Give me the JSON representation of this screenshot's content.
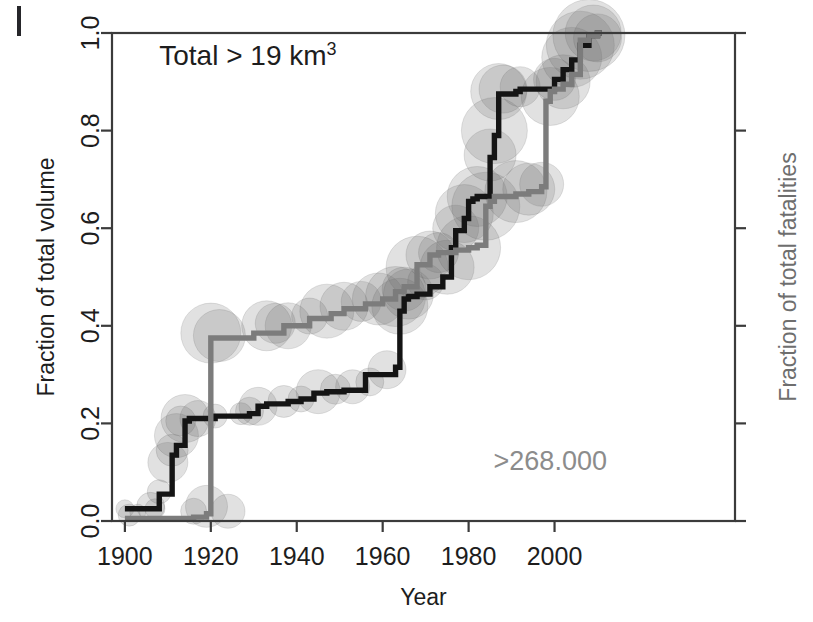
{
  "figure": {
    "background_color": "#ffffff",
    "scan_artifact": "vertical-bar-top-left"
  },
  "chart_data": {
    "type": "line",
    "title": "",
    "xlabel": "Year",
    "ylabel": "Fraction of total volume",
    "ylabel_right": "Fraction of total fatalities",
    "xlim": [
      1897,
      2042
    ],
    "ylim": [
      0.0,
      1.0
    ],
    "grid": false,
    "legend": "none",
    "x_ticks": [
      1900,
      1920,
      1940,
      1960,
      1980,
      2000
    ],
    "x_tick_labels": [
      "1900",
      "1920",
      "1940",
      "1960",
      "1980",
      "2000"
    ],
    "y_ticks": [
      0.0,
      0.2,
      0.4,
      0.6,
      0.8,
      1.0
    ],
    "y_tick_labels": [
      "0.0",
      "0.2",
      "0.4",
      "0.6",
      "0.8",
      "1.0"
    ],
    "y_ticks_right": [
      0.0,
      0.2,
      0.4,
      0.6,
      0.8,
      1.0
    ],
    "y_tick_labels_right": [
      "",
      "",
      "",
      "",
      "",
      ""
    ],
    "annotations": [
      {
        "name": "total-volume-annotation",
        "text": "Total > 19 km",
        "superscript": "3",
        "color": "#1d1d1d",
        "x": 1908,
        "y": 0.935
      },
      {
        "name": "total-fatalities-annotation",
        "text": ">268.000",
        "color": "#8c8c8c",
        "x": 1999,
        "y": 0.105
      }
    ],
    "series": [
      {
        "name": "Fraction of total volume",
        "color": "#141414",
        "axis": "left",
        "step": true,
        "x": [
          1900,
          1907,
          1908,
          1911,
          1912,
          1914,
          1915,
          1921,
          1929,
          1931,
          1933,
          1938,
          1941,
          1944,
          1947,
          1951,
          1953,
          1955,
          1956,
          1963,
          1964,
          1965,
          1966,
          1968,
          1971,
          1974,
          1976,
          1977,
          1979,
          1980,
          1981,
          1982,
          1985,
          1986,
          1987,
          1991,
          1992,
          2000,
          2002,
          2004,
          2006,
          2008,
          2010,
          2011
        ],
        "y": [
          0.025,
          0.025,
          0.055,
          0.135,
          0.155,
          0.205,
          0.21,
          0.215,
          0.22,
          0.235,
          0.24,
          0.245,
          0.25,
          0.262,
          0.265,
          0.268,
          0.268,
          0.268,
          0.3,
          0.315,
          0.43,
          0.455,
          0.46,
          0.465,
          0.48,
          0.5,
          0.56,
          0.595,
          0.62,
          0.655,
          0.66,
          0.665,
          0.745,
          0.79,
          0.875,
          0.88,
          0.885,
          0.905,
          0.925,
          0.945,
          0.975,
          0.995,
          1.0,
          1.0
        ]
      },
      {
        "name": "Fraction of total fatalities",
        "color": "#7c7c7c",
        "axis": "right",
        "step": true,
        "x": [
          1900,
          1912,
          1916,
          1919,
          1920,
          1930,
          1937,
          1943,
          1948,
          1951,
          1956,
          1960,
          1963,
          1965,
          1968,
          1971,
          1973,
          1977,
          1980,
          1982,
          1984,
          1985,
          1986,
          1991,
          1994,
          1997,
          1998,
          1999,
          2000,
          2002,
          2004,
          2006,
          2008,
          2010,
          2011
        ],
        "y": [
          0.005,
          0.005,
          0.008,
          0.015,
          0.375,
          0.385,
          0.4,
          0.415,
          0.425,
          0.435,
          0.445,
          0.455,
          0.47,
          0.48,
          0.525,
          0.545,
          0.55,
          0.555,
          0.56,
          0.565,
          0.645,
          0.655,
          0.665,
          0.67,
          0.675,
          0.685,
          0.86,
          0.88,
          0.885,
          0.895,
          0.915,
          0.985,
          0.995,
          1.0,
          1.0
        ]
      }
    ],
    "bubbles": {
      "description": "semi-transparent gray circles sized by event magnitude, overlaid on both step curves",
      "color": "#6b6b6b",
      "opacity": 0.2,
      "points": [
        {
          "x": 1900,
          "y": 0.025,
          "r": 9
        },
        {
          "x": 1901,
          "y": 0.012,
          "r": 11
        },
        {
          "x": 1903,
          "y": 0.018,
          "r": 8
        },
        {
          "x": 1906,
          "y": 0.03,
          "r": 14
        },
        {
          "x": 1907,
          "y": 0.025,
          "r": 10
        },
        {
          "x": 1908,
          "y": 0.06,
          "r": 12
        },
        {
          "x": 1910,
          "y": 0.12,
          "r": 20
        },
        {
          "x": 1911,
          "y": 0.145,
          "r": 16
        },
        {
          "x": 1912,
          "y": 0.175,
          "r": 22
        },
        {
          "x": 1913,
          "y": 0.205,
          "r": 15
        },
        {
          "x": 1914,
          "y": 0.21,
          "r": 24
        },
        {
          "x": 1916,
          "y": 0.02,
          "r": 13
        },
        {
          "x": 1917,
          "y": 0.21,
          "r": 18
        },
        {
          "x": 1919,
          "y": 0.03,
          "r": 21
        },
        {
          "x": 1920,
          "y": 0.385,
          "r": 30
        },
        {
          "x": 1921,
          "y": 0.215,
          "r": 12
        },
        {
          "x": 1922,
          "y": 0.38,
          "r": 26
        },
        {
          "x": 1924,
          "y": 0.02,
          "r": 17
        },
        {
          "x": 1927,
          "y": 0.22,
          "r": 11
        },
        {
          "x": 1929,
          "y": 0.225,
          "r": 14
        },
        {
          "x": 1931,
          "y": 0.235,
          "r": 19
        },
        {
          "x": 1933,
          "y": 0.4,
          "r": 25
        },
        {
          "x": 1935,
          "y": 0.405,
          "r": 20
        },
        {
          "x": 1937,
          "y": 0.245,
          "r": 16
        },
        {
          "x": 1938,
          "y": 0.4,
          "r": 23
        },
        {
          "x": 1941,
          "y": 0.25,
          "r": 13
        },
        {
          "x": 1943,
          "y": 0.42,
          "r": 18
        },
        {
          "x": 1945,
          "y": 0.265,
          "r": 22
        },
        {
          "x": 1947,
          "y": 0.43,
          "r": 27
        },
        {
          "x": 1949,
          "y": 0.27,
          "r": 15
        },
        {
          "x": 1951,
          "y": 0.44,
          "r": 24
        },
        {
          "x": 1953,
          "y": 0.275,
          "r": 17
        },
        {
          "x": 1955,
          "y": 0.45,
          "r": 20
        },
        {
          "x": 1957,
          "y": 0.285,
          "r": 14
        },
        {
          "x": 1959,
          "y": 0.455,
          "r": 26
        },
        {
          "x": 1961,
          "y": 0.31,
          "r": 19
        },
        {
          "x": 1963,
          "y": 0.46,
          "r": 30
        },
        {
          "x": 1964,
          "y": 0.44,
          "r": 28
        },
        {
          "x": 1965,
          "y": 0.475,
          "r": 22
        },
        {
          "x": 1966,
          "y": 0.465,
          "r": 25
        },
        {
          "x": 1968,
          "y": 0.52,
          "r": 31
        },
        {
          "x": 1970,
          "y": 0.49,
          "r": 18
        },
        {
          "x": 1971,
          "y": 0.545,
          "r": 24
        },
        {
          "x": 1973,
          "y": 0.55,
          "r": 20
        },
        {
          "x": 1975,
          "y": 0.52,
          "r": 27
        },
        {
          "x": 1977,
          "y": 0.6,
          "r": 23
        },
        {
          "x": 1979,
          "y": 0.63,
          "r": 29
        },
        {
          "x": 1980,
          "y": 0.56,
          "r": 32
        },
        {
          "x": 1982,
          "y": 0.665,
          "r": 30
        },
        {
          "x": 1984,
          "y": 0.645,
          "r": 34
        },
        {
          "x": 1985,
          "y": 0.75,
          "r": 26
        },
        {
          "x": 1986,
          "y": 0.8,
          "r": 33
        },
        {
          "x": 1987,
          "y": 0.88,
          "r": 28
        },
        {
          "x": 1988,
          "y": 0.885,
          "r": 24
        },
        {
          "x": 1991,
          "y": 0.675,
          "r": 31
        },
        {
          "x": 1992,
          "y": 0.89,
          "r": 20
        },
        {
          "x": 1994,
          "y": 0.68,
          "r": 26
        },
        {
          "x": 1997,
          "y": 0.69,
          "r": 22
        },
        {
          "x": 1999,
          "y": 0.87,
          "r": 29
        },
        {
          "x": 2000,
          "y": 0.905,
          "r": 21
        },
        {
          "x": 2002,
          "y": 0.9,
          "r": 27
        },
        {
          "x": 2004,
          "y": 0.95,
          "r": 30
        },
        {
          "x": 2006,
          "y": 0.975,
          "r": 34
        },
        {
          "x": 2008,
          "y": 0.995,
          "r": 36
        },
        {
          "x": 2009,
          "y": 1.0,
          "r": 28
        },
        {
          "x": 2010,
          "y": 0.99,
          "r": 24
        }
      ]
    }
  }
}
